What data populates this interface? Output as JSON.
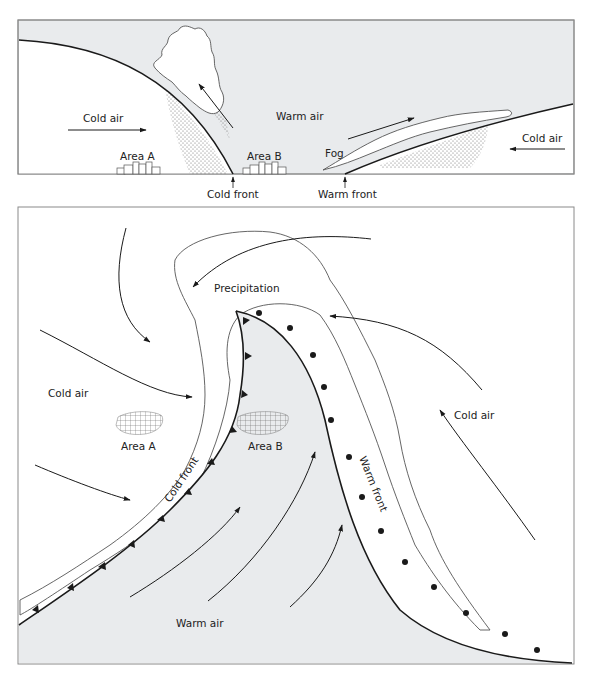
{
  "colors": {
    "warm_fill": "#e9ebed",
    "cold_fill": "#ffffff",
    "line": "#1a1a1a",
    "cloud_line": "#555555",
    "frame": "#8a8a8a"
  },
  "cross_section": {
    "labels": {
      "cold_air_left": "Cold air",
      "warm_air": "Warm air",
      "cold_air_right": "Cold air",
      "area_a": "Area A",
      "area_b": "Area B",
      "fog": "Fog",
      "cold_front": "Cold front",
      "warm_front": "Warm front"
    }
  },
  "plan_view": {
    "labels": {
      "precipitation": "Precipitation",
      "cold_air_left": "Cold air",
      "cold_air_right": "Cold air",
      "area_a": "Area A",
      "area_b": "Area B",
      "cold_front": "Cold front",
      "warm_front": "Warm front",
      "warm_air": "Warm air"
    }
  }
}
